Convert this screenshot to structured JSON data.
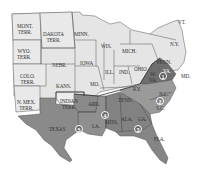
{
  "map": {
    "title": "",
    "colors": {
      "union": "#e4e4e4",
      "territory": "#e8e8e8",
      "confederate": "#8c8c8c",
      "confederate_dark": "#6e6e6e",
      "border": "#555555",
      "background": "#ffffff"
    },
    "regions": [
      {
        "id": "mont",
        "label": "MONT.\nTERR.",
        "l1": "MONT.",
        "l2": "TERR.",
        "type": "territory"
      },
      {
        "id": "dakota",
        "l1": "DAKOTA",
        "l2": "TERR.",
        "type": "territory"
      },
      {
        "id": "minn",
        "l1": "MINN.",
        "type": "union"
      },
      {
        "id": "wyo",
        "l1": "WYO.",
        "l2": "TERR.",
        "type": "territory"
      },
      {
        "id": "wis",
        "l1": "WIS.",
        "type": "union"
      },
      {
        "id": "mich",
        "l1": "MICH.",
        "type": "union"
      },
      {
        "id": "ny",
        "l1": "N.Y.",
        "type": "union"
      },
      {
        "id": "vt",
        "l1": "VT.",
        "type": "union"
      },
      {
        "id": "nebr",
        "l1": "NEBR.",
        "type": "union"
      },
      {
        "id": "iowa",
        "l1": "IOWA",
        "type": "union"
      },
      {
        "id": "penn",
        "l1": "PENN.",
        "type": "union"
      },
      {
        "id": "colo",
        "l1": "COLO.",
        "l2": "TERR.",
        "type": "territory"
      },
      {
        "id": "ill",
        "l1": "ILL.",
        "type": "union"
      },
      {
        "id": "ind",
        "l1": "IND.",
        "type": "union"
      },
      {
        "id": "ohio",
        "l1": "OHIO",
        "type": "union"
      },
      {
        "id": "wva",
        "l1": "W.",
        "l2": "VA.",
        "type": "union"
      },
      {
        "id": "kans",
        "l1": "KANS.",
        "type": "union"
      },
      {
        "id": "mo",
        "l1": "MO.",
        "type": "union"
      },
      {
        "id": "ky",
        "l1": "KY.",
        "type": "union"
      },
      {
        "id": "va",
        "l1": "VA.",
        "type": "confederate"
      },
      {
        "id": "md",
        "l1": "MD.",
        "type": "union"
      },
      {
        "id": "nmex",
        "l1": "N. MEX.",
        "l2": "TERR.",
        "type": "territory"
      },
      {
        "id": "indian",
        "l1": "INDIAN",
        "l2": "TERR.",
        "type": "territory"
      },
      {
        "id": "tenn",
        "l1": "TENN.",
        "type": "union"
      },
      {
        "id": "nc",
        "l1": "N.C.",
        "type": "confederate"
      },
      {
        "id": "sc",
        "l1": "S.C.",
        "type": "confederate"
      },
      {
        "id": "ark",
        "l1": "ARK.",
        "type": "confederate"
      },
      {
        "id": "miss",
        "l1": "MISS.",
        "type": "confederate"
      },
      {
        "id": "ala",
        "l1": "ALA.",
        "type": "confederate"
      },
      {
        "id": "ga",
        "l1": "GA.",
        "type": "confederate"
      },
      {
        "id": "la",
        "l1": "LA.",
        "type": "confederate"
      },
      {
        "id": "texas",
        "l1": "TEXAS",
        "type": "confederate"
      },
      {
        "id": "fla",
        "l1": "FLA.",
        "type": "confederate"
      }
    ],
    "markers": [
      {
        "number": "1",
        "region": "Virginia"
      },
      {
        "number": "2",
        "region": "Carolinas"
      },
      {
        "number": "3",
        "region": "Alabama/Georgia"
      },
      {
        "number": "4",
        "region": "Arkansas/Louisiana"
      },
      {
        "number": "5",
        "region": "Texas"
      }
    ]
  }
}
